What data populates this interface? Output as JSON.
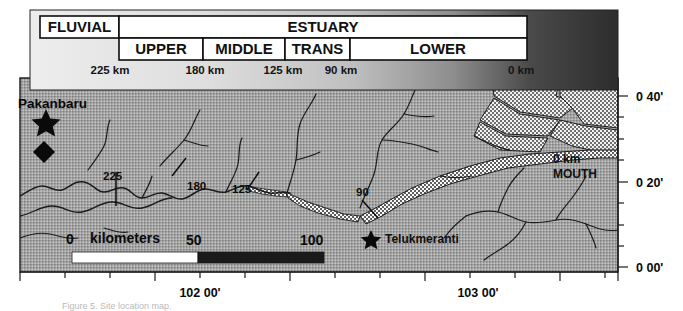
{
  "figure": {
    "caption": "Figure 5. Site location map."
  },
  "header_panel": {
    "row1": [
      {
        "label": "FLUVIAL",
        "x": 40,
        "w": 79
      },
      {
        "label": "ESTUARY",
        "x": 119,
        "w": 408
      }
    ],
    "row2": [
      {
        "label": "UPPER",
        "x": 119,
        "w": 84
      },
      {
        "label": "MIDDLE",
        "x": 203,
        "w": 82
      },
      {
        "label": "TRANS",
        "x": 285,
        "w": 65
      },
      {
        "label": "LOWER",
        "x": 350,
        "w": 177
      }
    ],
    "distance_ticks": [
      {
        "label": "225 km",
        "x": 110
      },
      {
        "label": "180 km",
        "x": 205
      },
      {
        "label": "125 km",
        "x": 283
      },
      {
        "label": "90 km",
        "x": 340
      },
      {
        "label": "0 km",
        "x": 520
      }
    ],
    "gradient": {
      "from": "#e8e8e8",
      "to": "#302f2f"
    }
  },
  "map": {
    "places": [
      {
        "name": "Pakanbaru",
        "label": "Pakanbaru",
        "marker": "star",
        "label_x": 18,
        "label_y": 104,
        "marker_x": 46,
        "marker_y": 120
      },
      {
        "name": "Telukmeranti",
        "label": "Telukmeranti",
        "marker": "star",
        "label_x": 385,
        "label_y": 243,
        "marker_x": 371,
        "marker_y": 238
      }
    ],
    "diamond_marker": {
      "x": 44,
      "y": 152
    },
    "mouth_label": {
      "line1": "0 km",
      "line2": "MOUTH",
      "x": 553,
      "y": 158
    },
    "river_km_marks": [
      {
        "label": "225",
        "x": 116,
        "y": 178,
        "tick_x": 116,
        "tick_y": 192
      },
      {
        "label": "180",
        "x": 194,
        "y": 186,
        "tick_x": 179,
        "tick_y": 166
      },
      {
        "label": "125",
        "x": 241,
        "y": 189,
        "tick_x": 253,
        "tick_y": 180
      },
      {
        "label": "90",
        "x": 362,
        "y": 193,
        "tick_x": 369,
        "tick_y": 208
      }
    ],
    "scale_bar": {
      "label": "kilometers",
      "ticks": [
        "0",
        "50",
        "100"
      ],
      "x": 72,
      "y": 252,
      "width": 252,
      "height": 11,
      "segment_colors": [
        "#ffffff",
        "#1a1a1a"
      ]
    },
    "axes": {
      "latitude": [
        {
          "label": "0 40'",
          "y": 96
        },
        {
          "label": "0 20'",
          "y": 182
        },
        {
          "label": "0 00'",
          "y": 267
        }
      ],
      "longitude": [
        {
          "label": "102 00'",
          "x": 200
        },
        {
          "label": "103 00'",
          "x": 478
        }
      ]
    },
    "colors": {
      "land_fill": "#9a9a9a",
      "delta_fill": "#cfcfcf",
      "river_stroke": "#1b1b1b",
      "frame_stroke": "#1a1a1a"
    },
    "frame": {
      "x": 20,
      "y": 78,
      "width": 598,
      "height": 194
    }
  }
}
